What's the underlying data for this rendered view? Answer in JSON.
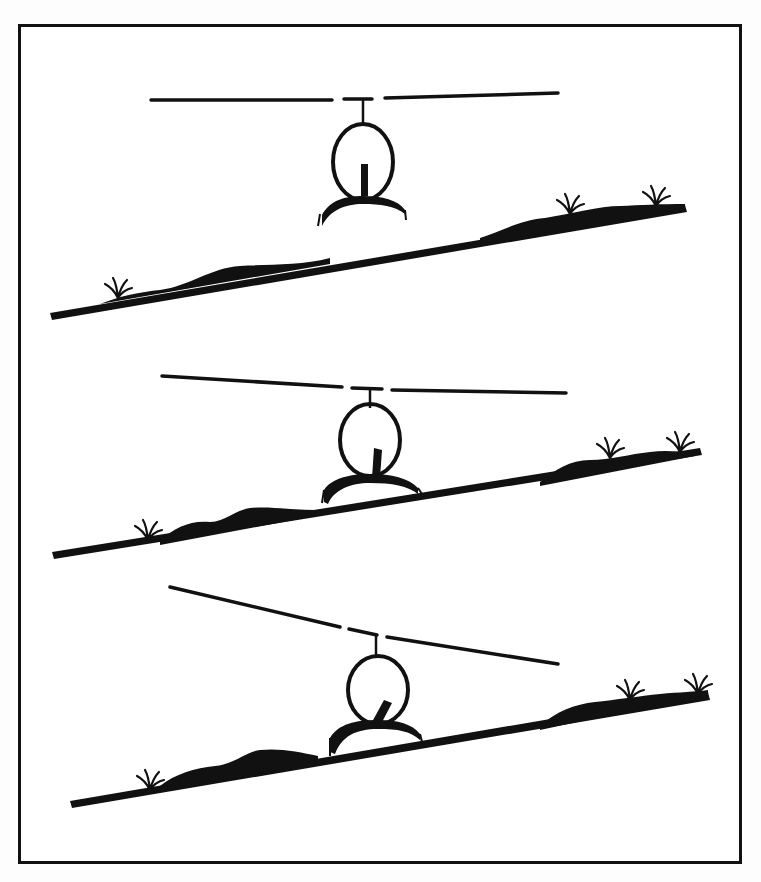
{
  "figure": {
    "description": "Helicopter slope landing sequence",
    "colors": {
      "ink": "#111111",
      "paper": "#ffffff"
    },
    "panels": [
      {
        "id": 1,
        "stage": "hover-over-slope",
        "rotor_tilt_deg": -1,
        "cyclic_tilt_deg": 0,
        "slope_deg": 12,
        "skids": "level-above-ground"
      },
      {
        "id": 2,
        "stage": "upslope-skid-touchdown",
        "rotor_tilt_deg": 1.5,
        "cyclic_tilt_deg": 12,
        "slope_deg": 12,
        "skids": "upslope-skid-contact"
      },
      {
        "id": 3,
        "stage": "both-skids-on-slope",
        "rotor_tilt_deg": 10,
        "cyclic_tilt_deg": 30,
        "slope_deg": 12,
        "skids": "both-skids-contact"
      }
    ]
  }
}
